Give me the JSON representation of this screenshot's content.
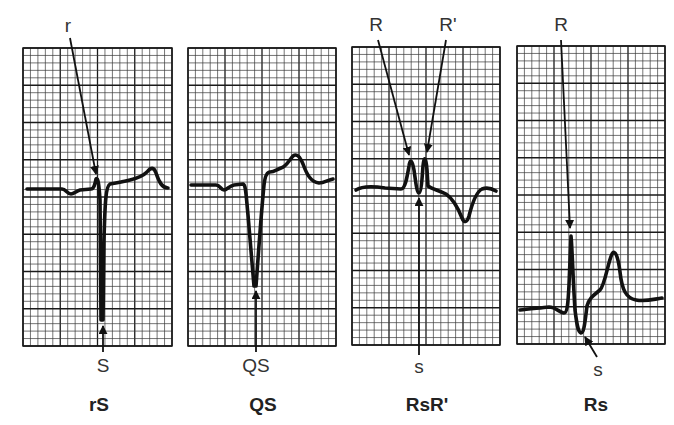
{
  "figure": {
    "colors": {
      "background": "#ffffff",
      "grid_minor": "#3a3a3a",
      "grid_major": "#1a1a1a",
      "trace": "#111111",
      "arrow": "#111111",
      "text": "#333333"
    },
    "grid": {
      "minor_px": 7.45,
      "major_every": 5
    },
    "panels": [
      {
        "id": "rS",
        "title": "rS",
        "box": {
          "x": 23,
          "y": 48,
          "w": 149,
          "h": 298
        },
        "top_labels": [
          {
            "text": "r",
            "x": 68,
            "y": 32,
            "arrow_from": [
              70,
              38
            ],
            "arrow_to": [
              96,
              174
            ]
          }
        ],
        "bottom_labels": [
          {
            "text": "S",
            "x": 103,
            "y": 372,
            "arrow_from": [
              103,
              352
            ],
            "arrow_to": [
              103,
              326
            ]
          }
        ],
        "title_pos": {
          "x": 99,
          "y": 411
        },
        "trace": "M27,189 L62,189 C66,189 67,194 71,194 C74,194 76,191 80,190 L91,189 C94,189 95,184 96,179 C98,177 99,184 100,200 L101,320 L103,320 L104,240 C105,200 106,186 110,184 C116,183 122,182 130,180 C138,178 143,176 147,172 C151,167 154,167 156,173 C159,182 162,188 168,188"
      },
      {
        "id": "QS",
        "title": "QS",
        "box": {
          "x": 188,
          "y": 48,
          "w": 148,
          "h": 298
        },
        "top_labels": [],
        "bottom_labels": [
          {
            "text": "QS",
            "x": 256,
            "y": 372,
            "arrow_from": [
              256,
              352
            ],
            "arrow_to": [
              256,
              291
            ]
          }
        ],
        "title_pos": {
          "x": 263,
          "y": 411
        },
        "trace": "M191,185 L216,185 C220,185 221,190 224,190 C227,190 229,186 234,185 L243,184 C246,185 246,195 248,215 L254,286 L256,286 C258,260 261,215 264,185 C265,176 267,172 270,172 C274,172 276,170 281,168 C287,166 289,160 293,156 C297,153 300,157 303,164 C307,175 311,182 319,183 C324,183 328,180 333,179"
      },
      {
        "id": "RsR-prime",
        "title": "RsR'",
        "box": {
          "x": 352,
          "y": 47,
          "w": 148,
          "h": 298
        },
        "top_labels": [
          {
            "text": "R",
            "x": 376,
            "y": 31,
            "arrow_from": [
              378,
              40
            ],
            "arrow_to": [
              409,
              155
            ]
          },
          {
            "text": "R'",
            "x": 448,
            "y": 31,
            "arrow_from": [
              446,
              40
            ],
            "arrow_to": [
              427,
              152
            ]
          }
        ],
        "bottom_labels": [
          {
            "text": "s",
            "x": 419,
            "y": 373,
            "arrow_from": [
              419,
              355
            ],
            "arrow_to": [
              419,
              198
            ]
          }
        ],
        "title_pos": {
          "x": 427,
          "y": 411
        },
        "trace": "M356,190 C362,186 372,186 385,188 L401,189 C405,189 407,178 409,166 C410,159 412,159 414,170 C416,184 417,193 419,193 C421,193 422,180 423,166 C424,156 426,156 427,170 L428,186 C432,189 438,190 446,194 C452,198 458,208 462,218 C464,223 467,223 469,216 C472,204 476,192 482,189 C487,187 491,188 496,191"
      },
      {
        "id": "Rs",
        "title": "Rs",
        "box": {
          "x": 517,
          "y": 46,
          "w": 148,
          "h": 298
        },
        "top_labels": [
          {
            "text": "R",
            "x": 561,
            "y": 31,
            "arrow_from": [
              561,
              40
            ],
            "arrow_to": [
              570,
              228
            ]
          }
        ],
        "bottom_labels": [
          {
            "text": "s",
            "x": 598,
            "y": 376,
            "arrow_from": [
              597,
              357
            ],
            "arrow_to": [
              585,
              337
            ]
          }
        ],
        "title_pos": {
          "x": 596,
          "y": 411
        },
        "trace": "M520,310 C528,309 540,308 549,307 C556,307 560,313 564,313 C567,313 568,305 569,285 L571,236 C572,244 573,280 575,310 C577,326 578,332 581,333 C584,333 585,322 587,306 C589,298 594,295 600,290 C605,285 608,262 612,254 C615,249 618,256 620,272 C622,290 626,298 636,300 C646,302 654,299 662,298"
      }
    ]
  },
  "chart_data": {
    "type": "diagram",
    "panels": [
      "rS",
      "QS",
      "RsR'",
      "Rs"
    ],
    "annotations": {
      "rS": [
        "r",
        "S"
      ],
      "QS": [
        "QS"
      ],
      "RsR'": [
        "R",
        "R'",
        "s"
      ],
      "Rs": [
        "R",
        "s"
      ]
    }
  }
}
